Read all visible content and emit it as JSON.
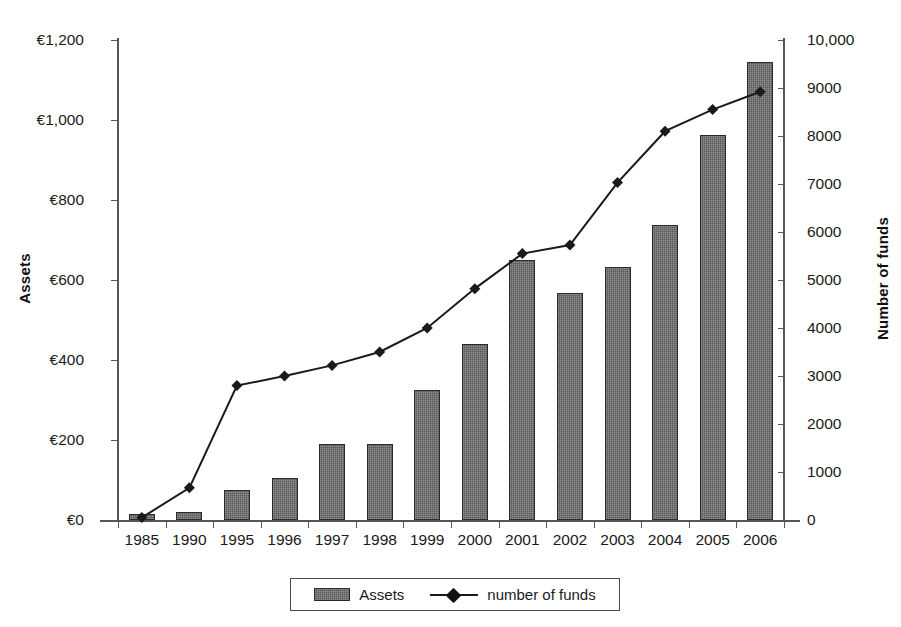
{
  "chart_data": {
    "type": "bar",
    "title": "",
    "xlabel": "",
    "ylabel": "Assets",
    "y2label": "Number of funds",
    "categories": [
      "1985",
      "1990",
      "1995",
      "1996",
      "1997",
      "1998",
      "1999",
      "2000",
      "2001",
      "2002",
      "2003",
      "2004",
      "2005",
      "2006"
    ],
    "series": [
      {
        "name": "Assets",
        "type": "bar",
        "axis": "left",
        "values": [
          15,
          20,
          75,
          105,
          190,
          190,
          325,
          440,
          650,
          567,
          633,
          737,
          962,
          1145
        ]
      },
      {
        "name": "number of funds",
        "type": "line",
        "axis": "right",
        "values": [
          50,
          670,
          2800,
          3000,
          3220,
          3500,
          4000,
          4820,
          5550,
          5730,
          7030,
          8100,
          8550,
          8920
        ]
      }
    ],
    "ylim": [
      0,
      1200
    ],
    "y2lim": [
      0,
      10000
    ],
    "yticks": [
      "€0",
      "€200",
      "€400",
      "€600",
      "€800",
      "€1,000",
      "€1,200"
    ],
    "ytick_values": [
      0,
      200,
      400,
      600,
      800,
      1000,
      1200
    ],
    "y2ticks": [
      "0",
      "1000",
      "2000",
      "3000",
      "4000",
      "5000",
      "6000",
      "7000",
      "8000",
      "9000",
      "10,000"
    ],
    "y2tick_values": [
      0,
      1000,
      2000,
      3000,
      4000,
      5000,
      6000,
      7000,
      8000,
      9000,
      10000
    ],
    "grid": false,
    "legend_position": "bottom",
    "colors": {
      "bar": "#5a5a5a",
      "bar_border": "#2b2b2b",
      "line": "#1a1a1a",
      "axis": "#555555",
      "background": "#ffffff"
    }
  },
  "legend": {
    "items": [
      {
        "label": "Assets",
        "marker": "bar-swatch"
      },
      {
        "label": "number of funds",
        "marker": "line-diamond"
      }
    ]
  }
}
